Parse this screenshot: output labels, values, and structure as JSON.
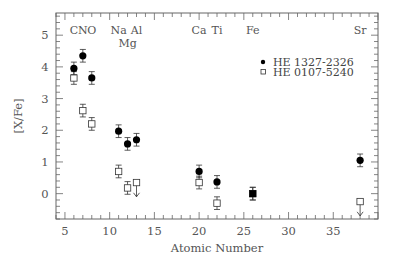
{
  "chart_data": {
    "type": "scatter",
    "title": "",
    "xlabel": "Atomic Number",
    "ylabel": "[X/Fe]",
    "xlim": [
      4,
      40
    ],
    "ylim": [
      -0.8,
      5.7
    ],
    "x_ticks": [
      5,
      10,
      15,
      20,
      25,
      30,
      35
    ],
    "x_tick_labels": [
      "5",
      "10",
      "15",
      "20",
      "25",
      "30",
      "35"
    ],
    "y_ticks": [
      0,
      1,
      2,
      3,
      4,
      5
    ],
    "y_tick_labels": [
      "0",
      "1",
      "2",
      "3",
      "4",
      "5"
    ],
    "grid": false,
    "legend_position": "upper-right",
    "element_labels": [
      {
        "text": "C",
        "x": 6,
        "row": 1
      },
      {
        "text": "N",
        "x": 7,
        "row": 1
      },
      {
        "text": "O",
        "x": 8,
        "row": 1
      },
      {
        "text": "Na",
        "x": 11,
        "row": 1
      },
      {
        "text": "Mg",
        "x": 12,
        "row": 2
      },
      {
        "text": "Al",
        "x": 13,
        "row": 1
      },
      {
        "text": "Ca",
        "x": 20,
        "row": 1
      },
      {
        "text": "Ti",
        "x": 22,
        "row": 1
      },
      {
        "text": "Fe",
        "x": 26,
        "row": 1
      },
      {
        "text": "Sr",
        "x": 38,
        "row": 1
      }
    ],
    "series": [
      {
        "name": "HE 1327-2326",
        "marker": "filled-circle",
        "color": "#000000",
        "points": [
          {
            "x": 6,
            "y": 3.95,
            "err": 0.2
          },
          {
            "x": 7,
            "y": 4.35,
            "err": 0.2
          },
          {
            "x": 8,
            "y": 3.65,
            "err": 0.2
          },
          {
            "x": 11,
            "y": 1.97,
            "err": 0.2
          },
          {
            "x": 12,
            "y": 1.57,
            "err": 0.2
          },
          {
            "x": 13,
            "y": 1.7,
            "err": 0.2
          },
          {
            "x": 20,
            "y": 0.7,
            "err": 0.2
          },
          {
            "x": 22,
            "y": 0.37,
            "err": 0.2
          },
          {
            "x": 26,
            "y": 0.0,
            "err": 0.2
          },
          {
            "x": 38,
            "y": 1.05,
            "err": 0.2
          }
        ]
      },
      {
        "name": "HE 0107-5240",
        "marker": "open-square",
        "color": "#000000",
        "points": [
          {
            "x": 6,
            "y": 3.65,
            "err": 0.2
          },
          {
            "x": 7,
            "y": 2.62,
            "err": 0.2
          },
          {
            "x": 8,
            "y": 2.2,
            "err": 0.2
          },
          {
            "x": 11,
            "y": 0.7,
            "err": 0.2
          },
          {
            "x": 12,
            "y": 0.18,
            "err": 0.2
          },
          {
            "x": 13,
            "y": 0.35,
            "upper_limit": true
          },
          {
            "x": 20,
            "y": 0.35,
            "err": 0.2
          },
          {
            "x": 22,
            "y": -0.3,
            "err": 0.2
          },
          {
            "x": 26,
            "y": 0.0,
            "err": 0.2
          },
          {
            "x": 38,
            "y": -0.25,
            "upper_limit": true
          }
        ]
      }
    ]
  }
}
